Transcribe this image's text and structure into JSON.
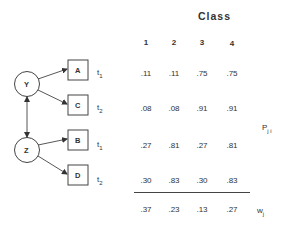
{
  "diagram": {
    "latent_nodes": [
      {
        "id": "Y",
        "label": "Y"
      },
      {
        "id": "Z",
        "label": "Z"
      }
    ],
    "observed_nodes": [
      {
        "id": "A",
        "label": "A",
        "parent": "Y",
        "time": "t",
        "time_sub": "1"
      },
      {
        "id": "C",
        "label": "C",
        "parent": "Y",
        "time": "t",
        "time_sub": "2"
      },
      {
        "id": "B",
        "label": "B",
        "parent": "Z",
        "time": "t",
        "time_sub": "1"
      },
      {
        "id": "D",
        "label": "D",
        "parent": "Z",
        "time": "t",
        "time_sub": "2"
      }
    ],
    "bidirectional_edge": [
      "Y",
      "Z"
    ]
  },
  "table": {
    "title": "Class",
    "columns": [
      "1",
      "2",
      "3",
      "4"
    ],
    "rows": [
      {
        "node": "A",
        "values": [
          ".11",
          ".11",
          ".75",
          ".75"
        ]
      },
      {
        "node": "C",
        "values": [
          ".08",
          ".08",
          ".91",
          ".91"
        ]
      },
      {
        "node": "B",
        "values": [
          ".27",
          ".81",
          ".27",
          ".81"
        ]
      },
      {
        "node": "D",
        "values": [
          ".30",
          ".83",
          ".30",
          ".83"
        ]
      }
    ],
    "prob_label": {
      "main": "P",
      "sub": "j i"
    },
    "weights": {
      "values": [
        ".37",
        ".23",
        ".13",
        ".27"
      ],
      "label_main": "w",
      "label_sub": "j"
    }
  }
}
